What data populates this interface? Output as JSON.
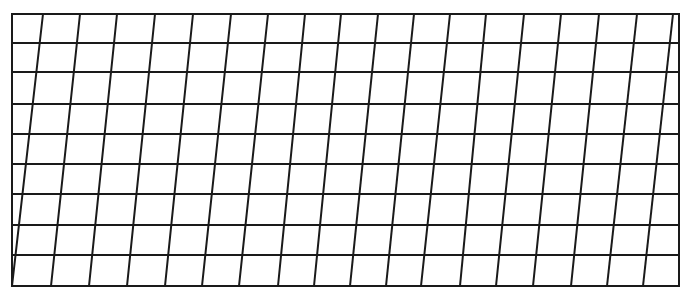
{
  "diagram": {
    "type": "sheared-grid",
    "stroke_color": "#1a1a1a",
    "background": "#ffffff",
    "stroke_width": 2,
    "frame": {
      "left": 12,
      "right": 679,
      "top": 14,
      "bottom": 286
    },
    "horizontal_lines_y": [
      14,
      43,
      72,
      104,
      134,
      164,
      194,
      225,
      255,
      286
    ],
    "slanted_lines": [
      {
        "x_top": 43,
        "x_bottom": 12
      },
      {
        "x_top": 80,
        "x_bottom": 51
      },
      {
        "x_top": 117,
        "x_bottom": 89
      },
      {
        "x_top": 155,
        "x_bottom": 127
      },
      {
        "x_top": 193,
        "x_bottom": 165
      },
      {
        "x_top": 231,
        "x_bottom": 202
      },
      {
        "x_top": 268,
        "x_bottom": 239
      },
      {
        "x_top": 305,
        "x_bottom": 278
      },
      {
        "x_top": 341,
        "x_bottom": 314
      },
      {
        "x_top": 378,
        "x_bottom": 350
      },
      {
        "x_top": 414,
        "x_bottom": 386
      },
      {
        "x_top": 450,
        "x_bottom": 421
      },
      {
        "x_top": 486,
        "x_bottom": 460
      },
      {
        "x_top": 524,
        "x_bottom": 496
      },
      {
        "x_top": 561,
        "x_bottom": 533
      },
      {
        "x_top": 599,
        "x_bottom": 571
      },
      {
        "x_top": 637,
        "x_bottom": 607
      },
      {
        "x_top": 673,
        "x_bottom": 643
      }
    ]
  }
}
